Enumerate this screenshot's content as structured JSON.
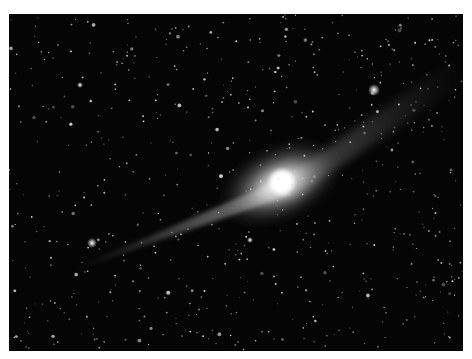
{
  "image": {
    "subject": "comet with long ion tail against a dense star field",
    "background_color": "#050505",
    "coma_color": "#f2f2f2",
    "tail_color": "#cfcfcf",
    "bright_stars": [
      {
        "x": 374,
        "y": 90
      },
      {
        "x": 92,
        "y": 243
      },
      {
        "x": 80,
        "y": 85
      },
      {
        "x": 250,
        "y": 240
      }
    ]
  }
}
